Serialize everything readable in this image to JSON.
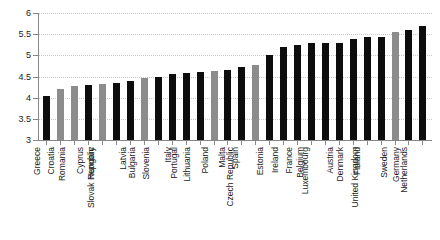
{
  "chart_data": {
    "type": "bar",
    "title": "",
    "subtitle": "",
    "xlabel": "",
    "ylabel": "",
    "ylim": [
      3,
      6
    ],
    "yticks": [
      3,
      3.5,
      4,
      4.5,
      5,
      5.5,
      6
    ],
    "ytick_labels": [
      "3",
      "3.5",
      "4",
      "4.5",
      "5",
      "5.5",
      "6"
    ],
    "grid": true,
    "legend": "none",
    "legend_position": "none",
    "bar_colors": {
      "dark": "#0d0d0d",
      "light": "#8c8c8c"
    },
    "categories": [
      "Greece",
      "Croatia",
      "Romania",
      "Cyprus",
      "Hungary",
      "Slovak Republic",
      "Latvia",
      "Bulgaria",
      "Slovenia",
      "Italy",
      "Portugal",
      "Lithuania",
      "Poland",
      "Malta",
      "Spain",
      "Czech Republic",
      "Estonia",
      "Ireland",
      "France",
      "Belgium",
      "Luxembourg",
      "Austria",
      "Denmark",
      "Finland",
      "United Kingdom",
      "Sweden",
      "Germany",
      "Netherlands"
    ],
    "values": [
      4.03,
      4.2,
      4.28,
      4.3,
      4.33,
      4.35,
      4.4,
      4.46,
      4.5,
      4.56,
      4.58,
      4.6,
      4.62,
      4.65,
      4.72,
      4.78,
      5.0,
      5.2,
      5.25,
      5.28,
      5.3,
      5.3,
      5.38,
      5.43,
      5.43,
      5.55,
      5.6,
      5.7
    ],
    "series_shades": [
      "dark",
      "light",
      "light",
      "dark",
      "light",
      "dark",
      "dark",
      "light",
      "dark",
      "dark",
      "dark",
      "dark",
      "light",
      "dark",
      "dark",
      "light",
      "dark",
      "dark",
      "dark",
      "dark",
      "dark",
      "dark",
      "dark",
      "dark",
      "dark",
      "light",
      "dark",
      "dark"
    ]
  }
}
